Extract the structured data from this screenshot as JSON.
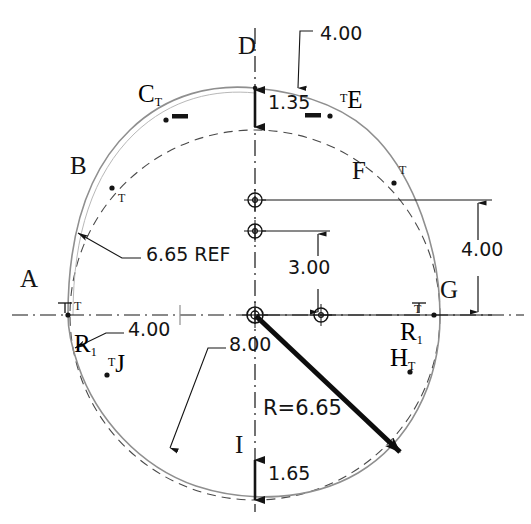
{
  "drawing": {
    "title": "Cam profile dimensioned engineering drawing",
    "type": "technical-drawing",
    "units": "inches",
    "colors": {
      "ink": "#141414",
      "profile": "#6d6d6d",
      "reference": "#4a4a4a",
      "background": "#ffffff"
    },
    "geometry": {
      "center": {
        "x": 255,
        "y": 315
      },
      "reference_circle_radius": 185,
      "profile_note": "non-circular cam profile offset from reference circle"
    }
  },
  "point_labels": [
    {
      "id": "A",
      "text": "A",
      "x": 22,
      "y": 278,
      "tick": "T",
      "tick_x": 60,
      "tick_y": 307
    },
    {
      "id": "B",
      "text": "B",
      "x": 73,
      "y": 165,
      "tick": "T",
      "tick_x": 113,
      "tick_y": 197
    },
    {
      "id": "C",
      "text": "C",
      "base": "C",
      "sub": "T",
      "x": 140,
      "y": 90
    },
    {
      "id": "D",
      "text": "D",
      "x": 240,
      "y": 44
    },
    {
      "id": "E",
      "text": "E",
      "base": "E",
      "sup": "T",
      "x": 345,
      "y": 96
    },
    {
      "id": "F",
      "text": "F",
      "x": 355,
      "y": 170,
      "tick": "T",
      "tick_x": 401,
      "tick_y": 172
    },
    {
      "id": "G",
      "text": "G",
      "x": 443,
      "y": 288,
      "tick": "T",
      "tick_x": 417,
      "tick_y": 310
    },
    {
      "id": "H",
      "text": "H",
      "base": "H",
      "sub": "T",
      "x": 394,
      "y": 355
    },
    {
      "id": "I",
      "text": "I",
      "x": 238,
      "y": 444
    },
    {
      "id": "J",
      "text": "J",
      "base": "J",
      "sup": "T",
      "x": 110,
      "y": 360
    }
  ],
  "radius_labels": [
    {
      "id": "R1-left",
      "base": "R",
      "sub": "1",
      "x": 78,
      "y": 341
    },
    {
      "id": "R1-right",
      "base": "R",
      "sub": "1",
      "x": 404,
      "y": 330
    }
  ],
  "dimensions": [
    {
      "id": "top-offset",
      "value": "4.00",
      "x": 320,
      "y": 34,
      "kind": "leader"
    },
    {
      "id": "top-gap",
      "value": "1.35",
      "x": 268,
      "y": 103,
      "kind": "linear-vertical"
    },
    {
      "id": "ref-radius",
      "value": "6.65 REF",
      "x": 146,
      "y": 255,
      "kind": "leader"
    },
    {
      "id": "left-offset",
      "value": "4.00",
      "x": 130,
      "y": 330,
      "kind": "leader"
    },
    {
      "id": "mid-vertical",
      "value": "3.00",
      "x": 290,
      "y": 268,
      "kind": "linear-vertical"
    },
    {
      "id": "right-vertical",
      "value": "4.00",
      "x": 463,
      "y": 250,
      "kind": "linear-vertical"
    },
    {
      "id": "lower-leader",
      "value": "8.00",
      "x": 230,
      "y": 345,
      "kind": "leader"
    },
    {
      "id": "radius-callout",
      "value": "R=6.65",
      "x": 264,
      "y": 410,
      "kind": "radius"
    },
    {
      "id": "bottom-gap",
      "value": "1.65",
      "x": 268,
      "y": 474,
      "kind": "linear-vertical"
    }
  ],
  "tolerance_marks": [
    {
      "id": "mark-left-of-D",
      "x": 178,
      "y": 117
    },
    {
      "id": "mark-right-of-D",
      "x": 311,
      "y": 116
    }
  ],
  "center_markers": [
    {
      "id": "hole-upper",
      "x": 255,
      "y": 200,
      "r": 7
    },
    {
      "id": "hole-mid",
      "x": 255,
      "y": 231,
      "r": 7
    },
    {
      "id": "hole-origin",
      "x": 255,
      "y": 315,
      "r": 8
    },
    {
      "id": "hole-right",
      "x": 321,
      "y": 315,
      "r": 7
    }
  ],
  "profile_points": [
    {
      "id": "pt-B",
      "x": 112,
      "y": 188
    },
    {
      "id": "pt-C",
      "x": 166,
      "y": 120
    },
    {
      "id": "pt-E",
      "x": 330,
      "y": 115
    },
    {
      "id": "pt-F",
      "x": 394,
      "y": 183
    },
    {
      "id": "pt-H",
      "x": 410,
      "y": 372
    },
    {
      "id": "pt-J",
      "x": 107,
      "y": 375
    },
    {
      "id": "pt-A",
      "x": 68,
      "y": 315
    }
  ]
}
